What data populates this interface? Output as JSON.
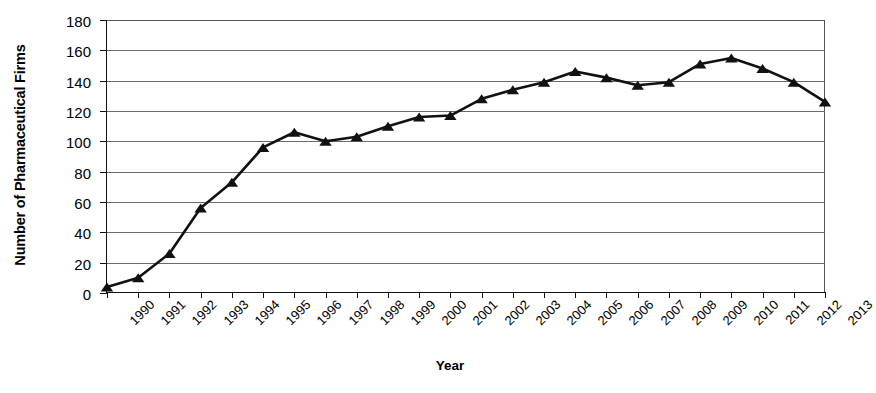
{
  "chart_data": {
    "type": "line",
    "title": "",
    "subtitle": "",
    "xlabel": "Year",
    "ylabel": "Number of Pharmaceutical Firms",
    "xlim": [
      1990,
      2013
    ],
    "ylim": [
      0,
      180
    ],
    "ytick_step": 20,
    "yticks": [
      0,
      20,
      40,
      60,
      80,
      100,
      120,
      140,
      160,
      180
    ],
    "grid": "horizontal",
    "legend": "none",
    "marker": "triangle",
    "line_color": "#111111",
    "marker_color": "#111111",
    "grid_color": "#6b6b6b",
    "background": "#ffffff",
    "categories": [
      "1990",
      "1991",
      "1992",
      "1993",
      "1994",
      "1995",
      "1996",
      "1997",
      "1998",
      "1999",
      "2000",
      "2001",
      "2002",
      "2003",
      "2004",
      "2005",
      "2006",
      "2007",
      "2008",
      "2009",
      "2010",
      "2011",
      "2012",
      "2013"
    ],
    "x": [
      1990,
      1991,
      1992,
      1993,
      1994,
      1995,
      1996,
      1997,
      1998,
      1999,
      2000,
      2001,
      2002,
      2003,
      2004,
      2005,
      2006,
      2007,
      2008,
      2009,
      2010,
      2011,
      2012,
      2013
    ],
    "series": [
      {
        "name": "Number of Pharmaceutical Firms",
        "values": [
          4,
          10,
          26,
          56,
          73,
          96,
          106,
          100,
          103,
          110,
          116,
          117,
          128,
          134,
          139,
          146,
          142,
          137,
          139,
          151,
          155,
          148,
          139,
          126
        ]
      }
    ],
    "annotations": []
  }
}
